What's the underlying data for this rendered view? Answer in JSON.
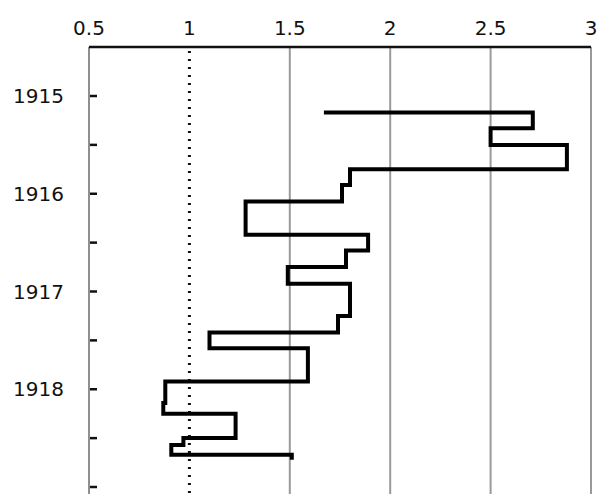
{
  "chart_data": {
    "type": "line",
    "subtype": "step",
    "title": "",
    "xlabel": "",
    "ylabel": "",
    "x_axis_position": "top",
    "xlim": [
      0.5,
      3
    ],
    "x_ticks": [
      0.5,
      1,
      1.5,
      2,
      2.5,
      3
    ],
    "x_tick_labels": [
      "0.5",
      "1",
      "1.5",
      "2",
      "2.5",
      "3"
    ],
    "y_axis_reversed": true,
    "ylim": [
      1914.5,
      1919.0
    ],
    "y_ticks": [
      1915,
      1915.5,
      1916,
      1916.5,
      1917,
      1917.5,
      1918,
      1918.5,
      1919
    ],
    "y_tick_labels": [
      "1915",
      "",
      "1916",
      "",
      "1917",
      "",
      "1918",
      "",
      ""
    ],
    "grid": {
      "vertical": true,
      "horizontal": false,
      "color": "#9a9a9a"
    },
    "reference_line": {
      "x": 1,
      "style": "dotted",
      "color": "#111111"
    },
    "series": [
      {
        "name": "ratio",
        "color": "#000000",
        "points": [
          {
            "y": 1915.17,
            "x": 1.68
          },
          {
            "y": 1915.17,
            "x": 2.71
          },
          {
            "y": 1915.33,
            "x": 2.71
          },
          {
            "y": 1915.33,
            "x": 2.5
          },
          {
            "y": 1915.5,
            "x": 2.5
          },
          {
            "y": 1915.5,
            "x": 2.88
          },
          {
            "y": 1915.75,
            "x": 2.88
          },
          {
            "y": 1915.75,
            "x": 1.8
          },
          {
            "y": 1915.91,
            "x": 1.8
          },
          {
            "y": 1915.91,
            "x": 1.76
          },
          {
            "y": 1916.08,
            "x": 1.76
          },
          {
            "y": 1916.08,
            "x": 1.28
          },
          {
            "y": 1916.42,
            "x": 1.28
          },
          {
            "y": 1916.42,
            "x": 1.89
          },
          {
            "y": 1916.58,
            "x": 1.89
          },
          {
            "y": 1916.58,
            "x": 1.78
          },
          {
            "y": 1916.75,
            "x": 1.78
          },
          {
            "y": 1916.75,
            "x": 1.49
          },
          {
            "y": 1916.92,
            "x": 1.49
          },
          {
            "y": 1916.92,
            "x": 1.8
          },
          {
            "y": 1917.25,
            "x": 1.8
          },
          {
            "y": 1917.25,
            "x": 1.74
          },
          {
            "y": 1917.42,
            "x": 1.74
          },
          {
            "y": 1917.42,
            "x": 1.1
          },
          {
            "y": 1917.58,
            "x": 1.1
          },
          {
            "y": 1917.58,
            "x": 1.59
          },
          {
            "y": 1917.92,
            "x": 1.59
          },
          {
            "y": 1917.92,
            "x": 0.88
          },
          {
            "y": 1918.14,
            "x": 0.88
          },
          {
            "y": 1918.14,
            "x": 0.87
          },
          {
            "y": 1918.25,
            "x": 0.87
          },
          {
            "y": 1918.25,
            "x": 1.23
          },
          {
            "y": 1918.5,
            "x": 1.23
          },
          {
            "y": 1918.5,
            "x": 0.97
          },
          {
            "y": 1918.57,
            "x": 0.97
          },
          {
            "y": 1918.57,
            "x": 0.91
          },
          {
            "y": 1918.67,
            "x": 0.91
          },
          {
            "y": 1918.67,
            "x": 1.51
          },
          {
            "y": 1918.7,
            "x": 1.51
          }
        ]
      }
    ]
  }
}
